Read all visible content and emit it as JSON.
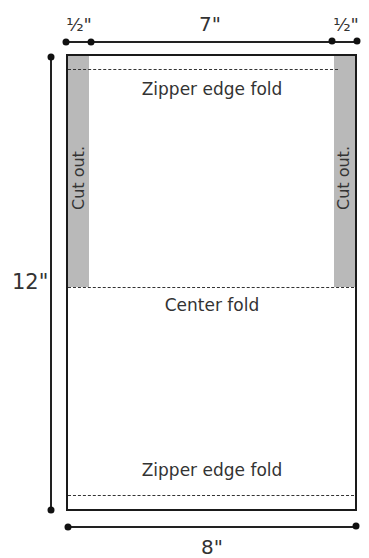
{
  "diagram": {
    "title": "",
    "dimensions": {
      "top_left_seam": "½\"",
      "top_middle": "7\"",
      "top_right_seam": "½\"",
      "height": "12\"",
      "width": "8\""
    },
    "regions": {
      "left_cutout": "Cut out.",
      "right_cutout": "Cut out."
    },
    "fold_lines": {
      "top": "Zipper edge fold",
      "center": "Center fold",
      "bottom": "Zipper edge fold"
    },
    "colors": {
      "outline": "#1a1a1a",
      "cutout_fill": "#b9b9b9",
      "background": "#ffffff"
    }
  }
}
